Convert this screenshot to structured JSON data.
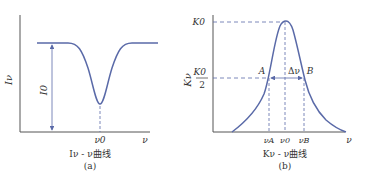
{
  "colors": {
    "curve": "#5a6aa8",
    "axis": "#555555",
    "dash": "#5a6aa8",
    "text": "#333333"
  },
  "panel_a": {
    "y_axis_label": "Iν",
    "x_axis_label": "ν",
    "depth_label": "I0",
    "center_tick": "ν0",
    "caption": "Iν - ν曲线",
    "sub_label": "(a)"
  },
  "panel_b": {
    "y_axis_label": "Kν",
    "peak_label": "K0",
    "half_label_num": "K0",
    "half_label_den": "2",
    "x_axis_label": "ν",
    "point_a": "A",
    "point_b": "B",
    "width_label": "Δν",
    "tick_a": "νA",
    "tick_0": "ν0",
    "tick_b": "νB",
    "caption": "Kν - ν曲线",
    "sub_label": "(b)"
  }
}
